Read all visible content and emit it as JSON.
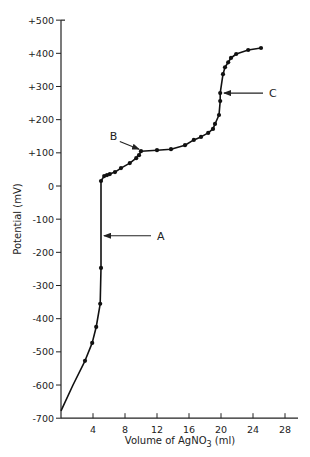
{
  "chart_data": {
    "type": "line",
    "title": "",
    "xlabel": "Volume of AgNO3 (ml)",
    "xlabel_parts": {
      "pre": "Volume of  AgNO",
      "sub": "3",
      "post": " (ml)"
    },
    "ylabel": "Potential (mV)",
    "xlim": [
      0,
      29
    ],
    "ylim": [
      -700,
      500
    ],
    "x_ticks": [
      4,
      8,
      12,
      16,
      20,
      24,
      28
    ],
    "y_ticks": [
      500,
      400,
      300,
      200,
      100,
      0,
      -100,
      -200,
      -300,
      -400,
      -500,
      -600,
      -700
    ],
    "y_tick_labels": [
      "+500",
      "+400",
      "+300",
      "+200",
      "+100",
      "0",
      "-100",
      "-200",
      "-300",
      "-400",
      "-500",
      "-600",
      "-700"
    ],
    "grid": false,
    "legend": null,
    "series": [
      {
        "name": "Titration curve",
        "curve": [
          [
            0,
            -678
          ],
          [
            1.5,
            -600
          ],
          [
            3.0,
            -527
          ],
          [
            3.9,
            -473
          ],
          [
            4.4,
            -425
          ],
          [
            4.9,
            -355
          ],
          [
            5.0,
            -247
          ],
          [
            5.0,
            15
          ],
          [
            5.4,
            30
          ],
          [
            5.75,
            33
          ],
          [
            6.1,
            36
          ],
          [
            6.75,
            42
          ],
          [
            7.5,
            54
          ],
          [
            8.6,
            69
          ],
          [
            9.4,
            84
          ],
          [
            9.75,
            93
          ],
          [
            10.0,
            105
          ],
          [
            12.0,
            108
          ],
          [
            13.75,
            111
          ],
          [
            15.5,
            123
          ],
          [
            16.6,
            139
          ],
          [
            17.5,
            148
          ],
          [
            18.4,
            160
          ],
          [
            19.0,
            172
          ],
          [
            19.25,
            187
          ],
          [
            19.75,
            214
          ],
          [
            19.9,
            256
          ],
          [
            19.9,
            280
          ],
          [
            20.25,
            337
          ],
          [
            20.5,
            358
          ],
          [
            20.9,
            373
          ],
          [
            21.25,
            386
          ],
          [
            21.9,
            398
          ],
          [
            23.4,
            410
          ],
          [
            25.0,
            416
          ]
        ],
        "points": [
          [
            3.0,
            -527
          ],
          [
            3.9,
            -473
          ],
          [
            4.4,
            -425
          ],
          [
            4.9,
            -355
          ],
          [
            5.0,
            -247
          ],
          [
            5.0,
            15
          ],
          [
            5.4,
            30
          ],
          [
            5.75,
            33
          ],
          [
            6.1,
            36
          ],
          [
            6.75,
            42
          ],
          [
            7.5,
            54
          ],
          [
            8.6,
            69
          ],
          [
            9.4,
            84
          ],
          [
            9.75,
            93
          ],
          [
            10.0,
            105
          ],
          [
            12.0,
            108
          ],
          [
            13.75,
            111
          ],
          [
            15.5,
            123
          ],
          [
            16.6,
            139
          ],
          [
            17.5,
            148
          ],
          [
            18.4,
            160
          ],
          [
            19.0,
            172
          ],
          [
            19.25,
            187
          ],
          [
            19.75,
            214
          ],
          [
            19.9,
            256
          ],
          [
            19.9,
            280
          ],
          [
            20.25,
            337
          ],
          [
            20.5,
            358
          ],
          [
            20.9,
            373
          ],
          [
            21.25,
            386
          ],
          [
            21.9,
            398
          ],
          [
            23.4,
            410
          ],
          [
            25.0,
            416
          ]
        ]
      }
    ],
    "annotations": [
      {
        "label": "A",
        "target": [
          5.0,
          -150
        ],
        "text_at": [
          12.0,
          -150
        ],
        "direction": "left"
      },
      {
        "label": "B",
        "target": [
          10.0,
          105
        ],
        "text_at": [
          6.6,
          140
        ],
        "direction": "down-right"
      },
      {
        "label": "C",
        "target": [
          20.0,
          280
        ],
        "text_at": [
          26.0,
          280
        ],
        "direction": "left"
      }
    ]
  }
}
